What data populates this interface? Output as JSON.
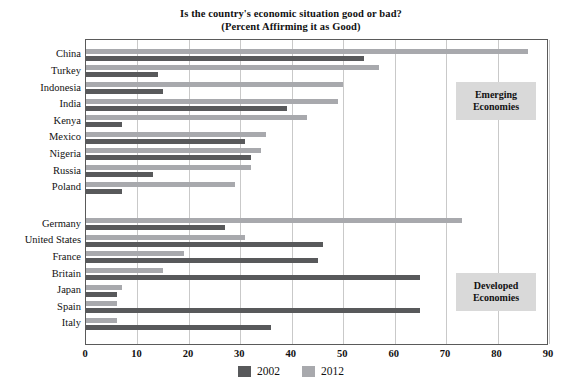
{
  "chart_data": {
    "type": "bar",
    "orientation": "horizontal",
    "title": "Is the country's economic situation good or bad?",
    "subtitle": "(Percent Affirming it as Good)",
    "xlabel": "",
    "ylabel": "",
    "xlim": [
      0,
      90
    ],
    "xticks": [
      0,
      10,
      20,
      30,
      40,
      50,
      60,
      70,
      80,
      90
    ],
    "grid": true,
    "legend_position": "bottom",
    "categories": [
      "China",
      "Turkey",
      "Indonesia",
      "India",
      "Kenya",
      "Mexico",
      "Nigeria",
      "Russia",
      "Poland",
      "Germany",
      "United States",
      "France",
      "Britain",
      "Japan",
      "Spain",
      "Italy"
    ],
    "series": [
      {
        "name": "2002",
        "color": "#58595b",
        "values": [
          54,
          14,
          15,
          39,
          7,
          31,
          32,
          13,
          7,
          27,
          46,
          45,
          65,
          6,
          65,
          36
        ]
      },
      {
        "name": "2012",
        "color": "#a8a9ad",
        "values": [
          86,
          57,
          50,
          49,
          43,
          35,
          34,
          32,
          29,
          73,
          31,
          19,
          15,
          7,
          6,
          6
        ]
      }
    ],
    "groups": [
      {
        "label": "Emerging\nEconomies",
        "members": [
          "China",
          "Turkey",
          "Indonesia",
          "India",
          "Kenya",
          "Mexico",
          "Nigeria",
          "Russia",
          "Poland"
        ]
      },
      {
        "label": "Developed\nEconomies",
        "members": [
          "Germany",
          "United States",
          "France",
          "Britain",
          "Japan",
          "Spain",
          "Italy"
        ]
      }
    ]
  },
  "annotations": {
    "emerging_line1": "Emerging",
    "emerging_line2": "Economies",
    "developed_line1": "Developed",
    "developed_line2": "Economies"
  },
  "legend": {
    "items": [
      {
        "label": "2002",
        "color": "#58595b"
      },
      {
        "label": "2012",
        "color": "#a8a9ad"
      }
    ]
  },
  "axis": {
    "x_tick_labels": [
      "0",
      "10",
      "20",
      "30",
      "40",
      "50",
      "60",
      "70",
      "80",
      "90"
    ]
  },
  "colors": {
    "series_2002": "#58595b",
    "series_2012": "#a8a9ad",
    "gridline": "#c9c9c9",
    "frame": "#5a5a5a",
    "annotation_box": "#d9d9d9"
  }
}
